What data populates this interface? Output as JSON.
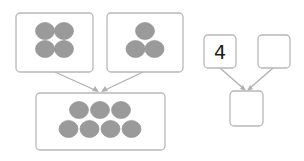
{
  "diagram": {
    "groups": [
      {
        "name": "left-part",
        "count": 4,
        "layout": [
          2,
          2
        ]
      },
      {
        "name": "right-part",
        "count": 3,
        "layout": [
          1,
          2
        ]
      },
      {
        "name": "whole",
        "count": 7,
        "layout": [
          3,
          4
        ]
      }
    ],
    "number_bond": {
      "part_a": "4",
      "part_b": "",
      "whole": ""
    },
    "colors": {
      "counter": "#9a9a9a",
      "border": "#b8b8b8",
      "arrow": "#b0b0b0"
    }
  }
}
